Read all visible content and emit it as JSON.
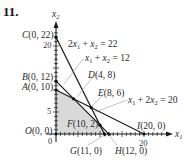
{
  "problem_number": "11.",
  "axes": {
    "x_label": "x",
    "x_sub": "1",
    "y_label": "x",
    "y_sub": "2",
    "x_ticks": [
      "0",
      "20"
    ],
    "y_ticks": [
      "5",
      "20"
    ]
  },
  "colors": {
    "feasible_region": "#d9d9d9",
    "lines": "#1a1a1a",
    "leader_lines": "#9a9a9a",
    "points": "#111111"
  },
  "constraints": [
    {
      "id": "c1",
      "a": "2",
      "b": "1",
      "rhs": "22",
      "equation": "2x1 + x2 = 22"
    },
    {
      "id": "c2",
      "a": "1",
      "b": "1",
      "rhs": "12",
      "equation": "x1 + x2 = 12"
    },
    {
      "id": "c3",
      "a": "1",
      "b": "2",
      "rhs": "20",
      "equation": "x1 + 2x2 = 20"
    }
  ],
  "equation_labels": {
    "c1": {
      "coef": "2",
      "rest_mid": " + ",
      "rhs": " = 22"
    },
    "c2": {
      "coef": "",
      "rest_mid": " + ",
      "rhs": " = 12"
    },
    "c3": {
      "coef": "",
      "rest_mid": " + 2",
      "rhs": " = 20"
    }
  },
  "points": [
    {
      "name": "O",
      "coords": "(0, 0)",
      "x": 0,
      "y": 0
    },
    {
      "name": "A",
      "coords": "(0, 10)",
      "x": 0,
      "y": 10
    },
    {
      "name": "B",
      "coords": "(0, 12)",
      "x": 0,
      "y": 12
    },
    {
      "name": "C",
      "coords": "(0, 22)",
      "x": 0,
      "y": 22
    },
    {
      "name": "D",
      "coords": "(4, 8)",
      "x": 4,
      "y": 8
    },
    {
      "name": "E",
      "coords": "(8, 6)",
      "x": 8,
      "y": 6
    },
    {
      "name": "F",
      "coords": "(10, 2)",
      "x": 10,
      "y": 2
    },
    {
      "name": "G",
      "coords": "(11, 0)",
      "x": 11,
      "y": 0
    },
    {
      "name": "H",
      "coords": "(12, 0)",
      "x": 12,
      "y": 0
    },
    {
      "name": "I",
      "coords": "(20, 0)",
      "x": 20,
      "y": 0
    }
  ],
  "feasible_region_vertices": [
    "O",
    "A",
    "D",
    "F",
    "G"
  ]
}
